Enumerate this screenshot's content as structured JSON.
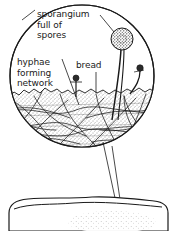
{
  "figure": {
    "type": "biological-line-drawing",
    "colors": {
      "ink": "#1a1a1a",
      "background": "#ffffff",
      "stipple": "#2b2b2b"
    },
    "labels": {
      "sporangium": "sporangium\nfull of\nspores",
      "hyphae": "hyphae\nforming\nnetwork",
      "bread": "bread"
    },
    "magnifier": {
      "name": "magnified-circle",
      "cx": 82,
      "cy": 76,
      "rx": 72,
      "ry": 71
    },
    "specimen": {
      "name": "bread-slice",
      "top": 197
    },
    "structures": {
      "large_sporangium": {
        "cx": 122,
        "cy": 40,
        "r": 11
      },
      "small_sporangium_left": {
        "cx": 76,
        "cy": 78,
        "r": 3
      },
      "small_sporangium_right": {
        "cx": 140,
        "cy": 68,
        "r": 3.2
      }
    }
  }
}
